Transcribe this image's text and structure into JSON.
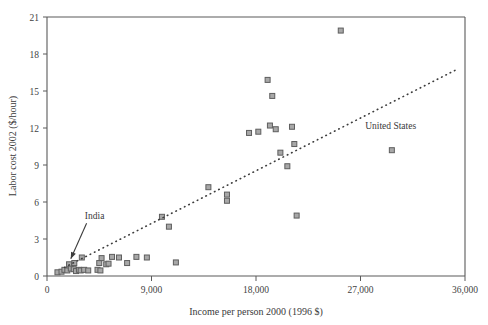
{
  "chart_data": {
    "type": "scatter",
    "title": "",
    "xlabel": "Income per person 2000 (1996 $)",
    "ylabel": "Labor cost 2002 ($/hour)",
    "xlim": [
      0,
      36000
    ],
    "ylim": [
      0,
      21
    ],
    "xticks": [
      0,
      9000,
      18000,
      27000,
      36000
    ],
    "xticklabels": [
      "0",
      "9,000",
      "18,000",
      "27,000",
      "36,000"
    ],
    "yticks": [
      0,
      3,
      6,
      9,
      12,
      15,
      18,
      21
    ],
    "yticklabels": [
      "0",
      "3",
      "6",
      "9",
      "12",
      "15",
      "18",
      "21"
    ],
    "grid": false,
    "legend": false,
    "marker": {
      "shape": "square",
      "fill": "#a8a8a8",
      "edge": "#5e5e5e",
      "size": 5
    },
    "points": [
      {
        "x": 900,
        "y": 0.3
      },
      {
        "x": 1250,
        "y": 0.35
      },
      {
        "x": 1500,
        "y": 0.5
      },
      {
        "x": 1750,
        "y": 0.45
      },
      {
        "x": 1900,
        "y": 0.95
      },
      {
        "x": 2050,
        "y": 0.6
      },
      {
        "x": 2300,
        "y": 0.55
      },
      {
        "x": 2350,
        "y": 1.05
      },
      {
        "x": 2500,
        "y": 0.4
      },
      {
        "x": 2750,
        "y": 0.5
      },
      {
        "x": 2900,
        "y": 0.45
      },
      {
        "x": 3000,
        "y": 1.5
      },
      {
        "x": 3200,
        "y": 0.5
      },
      {
        "x": 3550,
        "y": 0.45
      },
      {
        "x": 4350,
        "y": 0.5
      },
      {
        "x": 4500,
        "y": 1.05
      },
      {
        "x": 4600,
        "y": 0.45
      },
      {
        "x": 4700,
        "y": 1.45
      },
      {
        "x": 5100,
        "y": 0.95
      },
      {
        "x": 5300,
        "y": 1.0
      },
      {
        "x": 5600,
        "y": 1.55
      },
      {
        "x": 6200,
        "y": 1.5
      },
      {
        "x": 6900,
        "y": 1.05
      },
      {
        "x": 7700,
        "y": 1.55
      },
      {
        "x": 8600,
        "y": 1.5
      },
      {
        "x": 11100,
        "y": 1.1
      },
      {
        "x": 9900,
        "y": 4.8
      },
      {
        "x": 10500,
        "y": 4.0
      },
      {
        "x": 13900,
        "y": 7.2
      },
      {
        "x": 15500,
        "y": 6.6
      },
      {
        "x": 15500,
        "y": 6.1
      },
      {
        "x": 17400,
        "y": 11.6
      },
      {
        "x": 18200,
        "y": 11.7
      },
      {
        "x": 19000,
        "y": 15.9
      },
      {
        "x": 19400,
        "y": 14.6
      },
      {
        "x": 19200,
        "y": 12.2
      },
      {
        "x": 19700,
        "y": 11.9
      },
      {
        "x": 20100,
        "y": 10.0
      },
      {
        "x": 20700,
        "y": 8.9
      },
      {
        "x": 21100,
        "y": 12.1
      },
      {
        "x": 21300,
        "y": 10.7
      },
      {
        "x": 21500,
        "y": 4.9
      },
      {
        "x": 25300,
        "y": 19.9
      },
      {
        "x": 29700,
        "y": 10.2
      }
    ],
    "trendline": {
      "style": "dotted",
      "x_start": 1500,
      "y_start": 0.7,
      "x_end": 35200,
      "y_end": 16.7
    },
    "annotations": [
      {
        "label": "India",
        "label_x": 4100,
        "label_y": 4.6,
        "point_x": 2050,
        "point_y": 1.4,
        "has_arrow": true
      },
      {
        "label": "United States",
        "label_x": 29600,
        "label_y": 11.9,
        "point_x": 29700,
        "point_y": 10.2,
        "has_arrow": false
      }
    ]
  }
}
